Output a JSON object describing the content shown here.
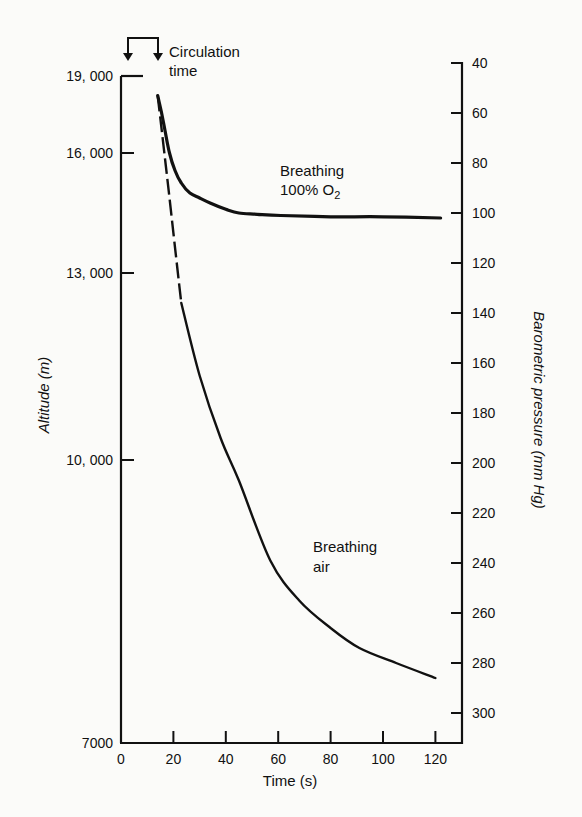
{
  "chart_data": {
    "type": "line",
    "title": "",
    "xlabel": "Time (s)",
    "ylabel_left": "Altitude (m)",
    "ylabel_right": "Barometric pressure (mm Hg)",
    "xlim": [
      0,
      130
    ],
    "x_ticks": [
      0,
      20,
      40,
      60,
      80,
      100,
      120
    ],
    "left_ticks": [
      {
        "label": "19, 000",
        "value": 19000,
        "y": 76
      },
      {
        "label": "16, 000",
        "value": 16000,
        "y": 153
      },
      {
        "label": "13, 000",
        "value": 13000,
        "y": 273
      },
      {
        "label": "10, 000",
        "value": 10000,
        "y": 460
      },
      {
        "label": "7000",
        "value": 7000,
        "y": 743
      }
    ],
    "right_ticks": [
      40,
      60,
      80,
      100,
      120,
      140,
      160,
      180,
      200,
      220,
      240,
      260,
      280,
      300
    ],
    "right_axis_inverted": true,
    "grid": false,
    "series": [
      {
        "name": "Breathing 100% O2",
        "style": "solid-thick",
        "x": [
          14,
          15.5,
          16.8,
          18.5,
          20.6,
          23,
          26.3,
          30,
          34,
          40,
          45,
          52,
          61,
          80,
          100,
          122
        ],
        "y_mmHg": [
          53,
          60,
          67,
          76,
          83,
          88,
          92,
          94,
          96,
          98.5,
          100,
          100.5,
          101,
          101.5,
          101.5,
          102
        ]
      },
      {
        "name": "Breathing air",
        "style": "dashed-then-solid",
        "dashed_until_x": 23,
        "x": [
          14,
          17,
          20,
          23,
          30,
          38,
          45,
          57,
          68,
          80,
          91,
          105,
          120
        ],
        "y_mmHg": [
          53,
          80,
          108,
          136,
          165,
          190,
          207,
          239,
          255,
          266,
          274,
          280,
          286
        ]
      }
    ],
    "annotations": [
      {
        "text_lines": [
          "Circulation",
          "time"
        ],
        "bracket_x": [
          3,
          14
        ]
      },
      {
        "text_lines": [
          "Breathing",
          "100% O",
          "2"
        ]
      },
      {
        "text_lines": [
          "Breathing",
          "air"
        ]
      }
    ]
  },
  "labels": {
    "circulation_1": "Circulation",
    "circulation_2": "time",
    "o2_1": "Breathing",
    "o2_2": "100% O",
    "o2_sub": "2",
    "air_1": "Breathing",
    "air_2": "air",
    "xaxis": "Time (s)",
    "yaxis_left": "Altitude (m)",
    "yaxis_right": "Barometric pressure (mm Hg)"
  }
}
